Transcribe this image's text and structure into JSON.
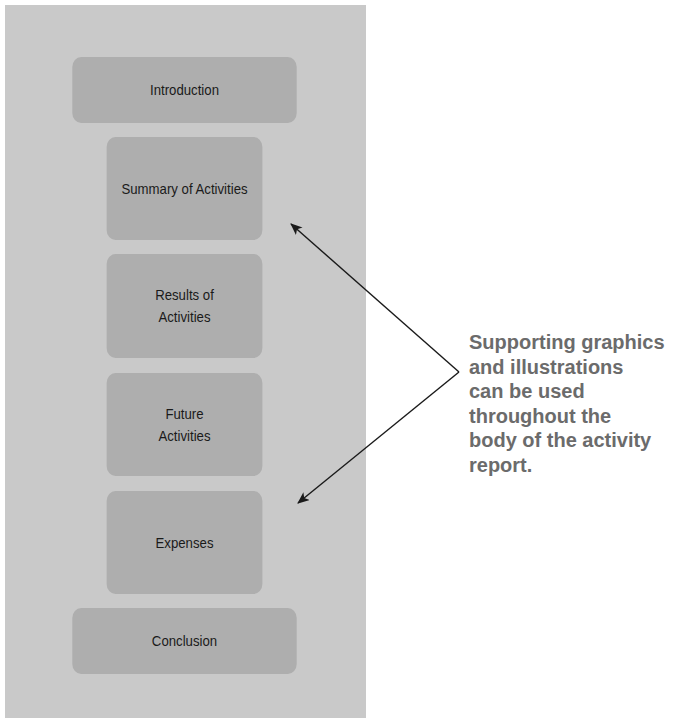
{
  "diagram": {
    "sections": [
      {
        "label": "Introduction"
      },
      {
        "label": "Summary of Activities"
      },
      {
        "label": "Results of\nActivities"
      },
      {
        "label": "Future\nActivities"
      },
      {
        "label": "Expenses"
      },
      {
        "label": "Conclusion"
      }
    ],
    "callout": {
      "text": "Supporting graphics\nand illustrations\ncan be used\nthroughout the\nbody of the activity\nreport."
    },
    "colors": {
      "panel": "#c9c9c9",
      "box": "#aeaeae",
      "callout_text": "#6b6b6b",
      "arrow": "#1a1a1a"
    }
  }
}
